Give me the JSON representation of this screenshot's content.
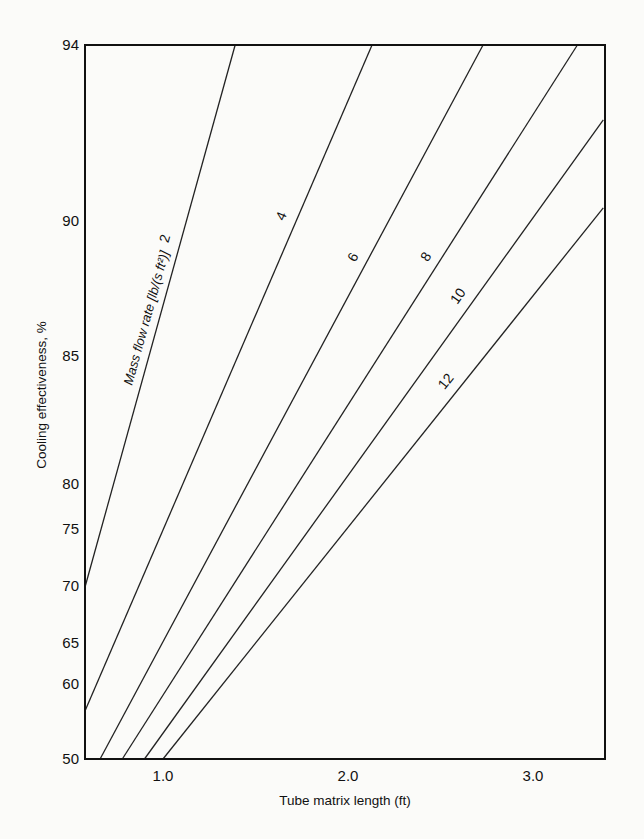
{
  "chart_data": {
    "type": "line",
    "title": "",
    "xlabel": "Tube matrix length (ft)",
    "ylabel": "Cooling effectiveness, %",
    "xlim": [
      0.58,
      3.38
    ],
    "ylim": [
      50,
      94
    ],
    "x_ticks": [
      "1.0",
      "2.0",
      "3.0"
    ],
    "x_tick_values": [
      1.0,
      2.0,
      3.0
    ],
    "y_ticks": [
      "50",
      "60",
      "65",
      "70",
      "75",
      "80",
      "85",
      "90",
      "94"
    ],
    "y_tick_values": [
      50,
      60,
      65,
      70,
      75,
      80,
      85,
      90,
      94
    ],
    "y_scale": "nonlinear (probability-style)",
    "grid": false,
    "annotation": "Mass flow rate [lb/(s  ft²)]",
    "series": [
      {
        "name": "2",
        "x": [
          0.58,
          1.39
        ],
        "y": [
          70.0,
          94.0
        ]
      },
      {
        "name": "4",
        "x": [
          0.58,
          2.13
        ],
        "y": [
          56.5,
          94.0
        ]
      },
      {
        "name": "6",
        "x": [
          0.66,
          2.73
        ],
        "y": [
          50.0,
          94.0
        ]
      },
      {
        "name": "8",
        "x": [
          0.78,
          3.24
        ],
        "y": [
          50.0,
          94.0
        ]
      },
      {
        "name": "10",
        "x": [
          0.9,
          3.38
        ],
        "y": [
          50.0,
          92.3
        ]
      },
      {
        "name": "12",
        "x": [
          1.0,
          3.38
        ],
        "y": [
          50.0,
          90.3
        ]
      }
    ]
  },
  "layout": {
    "plot_px": {
      "left": 85,
      "right": 605,
      "top": 45,
      "bottom": 759
    },
    "x_px_per_unit": 185,
    "x_px_at_1": 163,
    "y_tick_px": [
      759,
      684,
      643,
      586,
      529,
      484,
      356,
      221,
      45
    ],
    "curve_label_pos": [
      {
        "name": "2",
        "t": 0.64,
        "dx": -12,
        "dy": 0
      },
      {
        "name": "4",
        "t": 0.74,
        "dx": -12,
        "dy": 0
      },
      {
        "name": "6",
        "t": 0.7,
        "dx": -11,
        "dy": 0
      },
      {
        "name": "8",
        "t": 0.7,
        "dx": -11,
        "dy": 0
      },
      {
        "name": "10",
        "t": 0.72,
        "dx": -13,
        "dy": 0
      },
      {
        "name": "12",
        "t": 0.68,
        "dx": -13,
        "dy": 0
      }
    ],
    "annotation_anchor": {
      "x": 132,
      "y": 386
    }
  }
}
